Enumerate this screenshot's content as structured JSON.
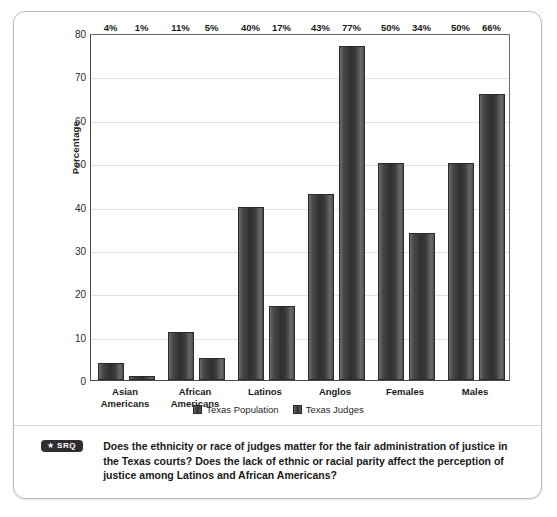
{
  "chart_data": {
    "type": "bar",
    "title": "",
    "xlabel": "",
    "ylabel": "Percentage",
    "ylim": [
      0,
      80
    ],
    "yticks": [
      0,
      10,
      20,
      30,
      40,
      50,
      60,
      70,
      80
    ],
    "grid": true,
    "legend_position": "bottom",
    "categories": [
      "Asian Americans",
      "African Americans",
      "Latinos",
      "Anglos",
      "Females",
      "Males"
    ],
    "category_lines": [
      [
        "Asian",
        "Americans"
      ],
      [
        "African",
        "Americans"
      ],
      [
        "Latinos"
      ],
      [
        "Anglos"
      ],
      [
        "Females"
      ],
      [
        "Males"
      ]
    ],
    "series": [
      {
        "name": "Texas Population",
        "values": [
          4,
          11,
          40,
          43,
          50,
          50
        ],
        "labels": [
          "4%",
          "11%",
          "40%",
          "43%",
          "50%",
          "50%"
        ]
      },
      {
        "name": "Texas Judges",
        "values": [
          1,
          5,
          17,
          77,
          34,
          66
        ],
        "labels": [
          "1%",
          "5%",
          "17%",
          "77%",
          "34%",
          "66%"
        ]
      }
    ]
  },
  "axis": {
    "y_title": "Percentage",
    "y_tick_labels": [
      "0",
      "10",
      "20",
      "30",
      "40",
      "50",
      "60",
      "70",
      "80"
    ]
  },
  "legend": {
    "items": [
      {
        "label": "Texas Population"
      },
      {
        "label": "Texas Judges"
      }
    ]
  },
  "footer": {
    "badge_star": "★",
    "badge_label": "SRQ",
    "question": "Does the ethnicity or race of judges matter for the fair administration of justice in the Texas courts? Does the lack of ethnic or racial parity affect the perception of justice among Latinos and African Americans?"
  },
  "colors": {
    "bar_dark": "#2f2f2f",
    "bar_light": "#6e6e6e",
    "frame_border": "#b9b9b9",
    "axis": "#4a4a4a",
    "gridline": "#e2e2e2",
    "badge_bg": "#2e2e2e",
    "text": "#1a1a1a"
  }
}
